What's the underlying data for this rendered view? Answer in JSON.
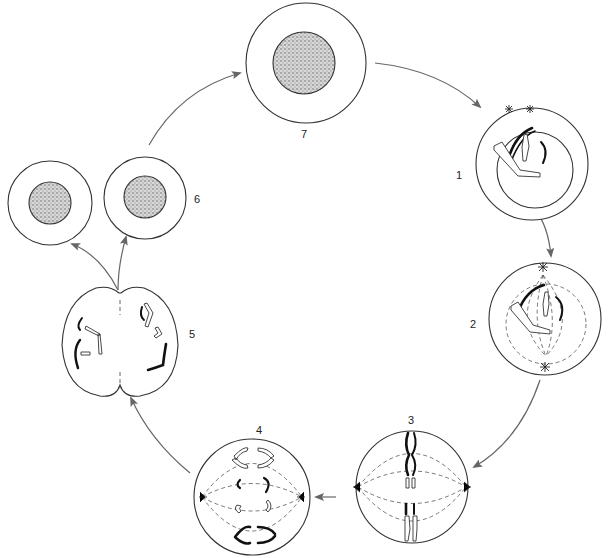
{
  "diagram": {
    "type": "cell-cycle (mitosis)",
    "stages": [
      {
        "id": "stage-1",
        "label": "1",
        "description": "prophase: two centrosomes, condensing chromosomes inside nuclear envelope"
      },
      {
        "id": "stage-2",
        "label": "2",
        "description": "prometaphase: spindle forming between poles"
      },
      {
        "id": "stage-3",
        "label": "3",
        "description": "metaphase: chromosomes aligned on spindle"
      },
      {
        "id": "stage-4",
        "label": "4",
        "description": "anaphase: chromatids separating toward poles"
      },
      {
        "id": "stage-5",
        "label": "5",
        "description": "telophase / cytokinesis: cleavage furrow"
      },
      {
        "id": "stage-6",
        "label": "6",
        "description": "two daughter cells"
      },
      {
        "id": "stage-7",
        "label": "7",
        "description": "interphase cell with nucleus"
      }
    ],
    "colors": {
      "outline": "#333333",
      "arrow": "#666666",
      "stipple": "#888888",
      "background": "#ffffff"
    }
  }
}
